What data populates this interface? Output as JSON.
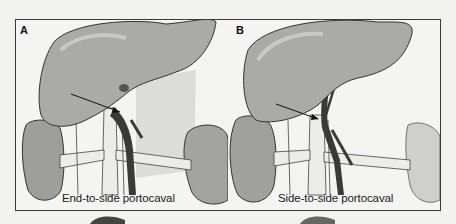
{
  "figure": {
    "type": "medical illustration",
    "panels": [
      {
        "label": "A",
        "caption": "End-to-side portocaval",
        "structures": [
          "liver",
          "portal vein",
          "inferior vena cava",
          "right kidney",
          "left kidney",
          "arrow"
        ]
      },
      {
        "label": "B",
        "caption": "Side-to-side portocaval",
        "structures": [
          "liver",
          "portal vein",
          "inferior vena cava",
          "right kidney",
          "left kidney",
          "arrow"
        ]
      }
    ],
    "colors": {
      "background": "#f2f2f0",
      "frame": "#3a3a3a",
      "organ_fill": "#a9a9a7",
      "organ_dark": "#7d7d7b",
      "vessel": "#3c3c3c",
      "vessel_light": "#e8e8e6"
    }
  }
}
